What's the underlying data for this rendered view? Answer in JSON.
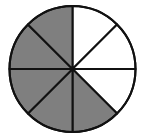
{
  "diagram": {
    "type": "fraction-circle",
    "total_parts": 8,
    "shaded_parts": 5,
    "fraction": "5/8",
    "center": [
      72.5,
      69
    ],
    "radius": 63,
    "colors": {
      "shaded": "#7f7f7f",
      "unshaded": "#ffffff",
      "stroke": "#111111"
    },
    "slices": [
      {
        "index": 0,
        "from_deg": -90,
        "to_deg": -45,
        "shaded": false
      },
      {
        "index": 1,
        "from_deg": -45,
        "to_deg": 0,
        "shaded": false
      },
      {
        "index": 2,
        "from_deg": 0,
        "to_deg": 45,
        "shaded": false
      },
      {
        "index": 3,
        "from_deg": 45,
        "to_deg": 90,
        "shaded": true
      },
      {
        "index": 4,
        "from_deg": 90,
        "to_deg": 135,
        "shaded": true
      },
      {
        "index": 5,
        "from_deg": 135,
        "to_deg": 180,
        "shaded": true
      },
      {
        "index": 6,
        "from_deg": 180,
        "to_deg": 225,
        "shaded": true
      },
      {
        "index": 7,
        "from_deg": 225,
        "to_deg": 270,
        "shaded": true
      }
    ]
  }
}
